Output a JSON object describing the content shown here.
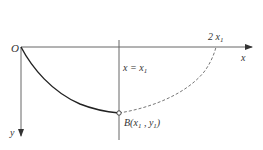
{
  "diagram": {
    "type": "brachistochrone-cycloid",
    "labels": {
      "origin": "O",
      "x_axis": "x",
      "y_axis": "y",
      "vertical_line": "x = x",
      "vertical_line_sub": "1",
      "top_mark": "2 x",
      "top_mark_sub": "1",
      "point_b": "B(",
      "point_b_x": "x",
      "point_b_x_sub": "1",
      "point_b_sep": " , ",
      "point_b_y": "y",
      "point_b_y_sub": "1",
      "point_b_close": ")"
    },
    "colors": {
      "axis": "#555555",
      "curve": "#222222",
      "dashed": "#777777"
    }
  }
}
